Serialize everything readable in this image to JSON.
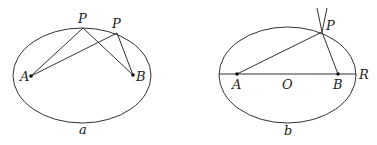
{
  "diagram": {
    "left": {
      "caption": "a",
      "ellipse": {
        "cx": 82,
        "cy": 75.5,
        "rx": 69,
        "ry": 47.5
      },
      "points": {
        "A": {
          "label": "A",
          "x": 31,
          "y": 76
        },
        "B": {
          "label": "B",
          "x": 133,
          "y": 75
        },
        "P1": {
          "label": "P",
          "x": 83,
          "y": 28
        },
        "P2": {
          "label": "P",
          "x": 117,
          "y": 33
        }
      },
      "segments": [
        [
          "A",
          "P1"
        ],
        [
          "P1",
          "B"
        ],
        [
          "A",
          "P2"
        ],
        [
          "P2",
          "B"
        ]
      ]
    },
    "right": {
      "caption": "b",
      "ellipse": {
        "cx": 287.5,
        "cy": 75,
        "rx": 68.5,
        "ry": 48
      },
      "points": {
        "A": {
          "label": "A",
          "x": 237,
          "y": 74
        },
        "B": {
          "label": "B",
          "x": 338,
          "y": 74
        },
        "O": {
          "label": "O",
          "x": 287,
          "y": 74
        },
        "P": {
          "label": "P",
          "x": 322,
          "y": 32
        },
        "R": {
          "label": "R",
          "x": 356,
          "y": 74
        }
      },
      "segments": [
        [
          "A",
          "P"
        ],
        [
          "P",
          "B"
        ],
        [
          "axis_left",
          "R"
        ]
      ],
      "extensions_from_P": [
        {
          "x": 317,
          "y": 8
        },
        {
          "x": 326,
          "y": 8
        }
      ]
    }
  }
}
